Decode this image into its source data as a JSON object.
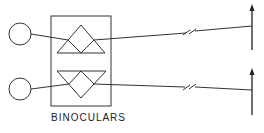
{
  "diagram": {
    "label": "BINOCULARS",
    "components": {
      "eyes": [
        "upper-eye",
        "lower-eye"
      ],
      "prisms": [
        "upper-prism",
        "lower-prism"
      ],
      "targets": [
        "upper-target-arrow",
        "lower-target-arrow"
      ]
    },
    "line_color": "#333333"
  }
}
